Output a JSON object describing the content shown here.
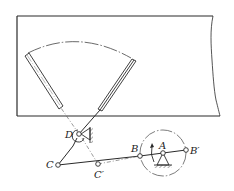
{
  "figure": {
    "type": "mechanism-diagram",
    "colors": {
      "line": "#2a2a2a",
      "center_line": "#555555",
      "background": "#ffffff"
    }
  },
  "labels": {
    "D": "D",
    "C": "C",
    "C_prime": "C′",
    "B": "B",
    "A": "A",
    "B_prime": "B′"
  },
  "points": {
    "D": [
      79,
      134
    ],
    "C": [
      58,
      165
    ],
    "C_prime": [
      98,
      164
    ],
    "B": [
      140,
      156
    ],
    "A": [
      163,
      153
    ],
    "B_prime": [
      186,
      150
    ]
  },
  "crank_circle": {
    "center": [
      163,
      153
    ],
    "radius": 23
  },
  "rotation_arrow": "counterclockwise"
}
